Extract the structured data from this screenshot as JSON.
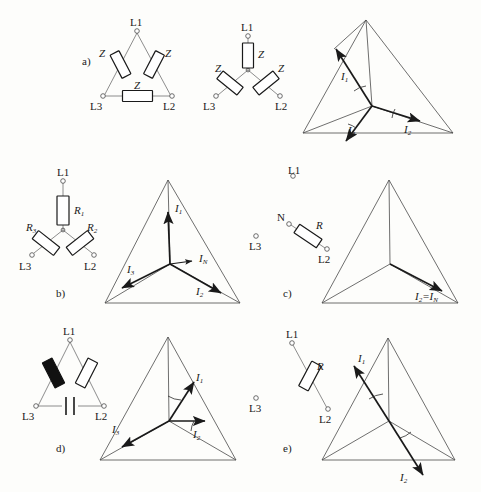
{
  "figure": {
    "sections": [
      {
        "id": "a",
        "label": "a)",
        "circuits": [
          "delta Z Z Z",
          "star Z Z Z"
        ],
        "phasors": [
          "I1",
          "I2",
          "I3"
        ]
      },
      {
        "id": "b",
        "label": "b)",
        "circuits": [
          "star R1 R2 R3"
        ],
        "phasors": [
          "I1",
          "I2",
          "I3",
          "IN"
        ]
      },
      {
        "id": "c",
        "label": "c)",
        "circuits": [
          "single R between N and L2"
        ],
        "phasors": [
          "I2=IN"
        ]
      },
      {
        "id": "d",
        "label": "d)",
        "circuits": [
          "delta with inductor, resistor, capacitor"
        ],
        "phasors": [
          "I1",
          "I2",
          "I3"
        ]
      },
      {
        "id": "e",
        "label": "e)",
        "circuits": [
          "single R between L1 and L2"
        ],
        "phasors": [
          "I1",
          "I2"
        ]
      }
    ]
  },
  "labels": {
    "L1": "L1",
    "L2": "L2",
    "L3": "L3",
    "N": "N",
    "Z": "Z",
    "R": "R",
    "R1": "R",
    "R1sub": "1",
    "R2": "R",
    "R2sub": "2",
    "R3": "R",
    "R3sub": "3",
    "I": "I",
    "i1": "1",
    "i2": "2",
    "i3": "3",
    "iN": "N",
    "I2eqIN": "=",
    "sect_a": "a)",
    "sect_b": "b)",
    "sect_c": "c)",
    "sect_d": "d)",
    "sect_e": "e)"
  },
  "colors": {
    "ink": "#1a1a1a",
    "thin_line": "#808080",
    "triangle": "#4a4a4a",
    "background": "#fdfdfb",
    "filled_element": "#111111"
  }
}
